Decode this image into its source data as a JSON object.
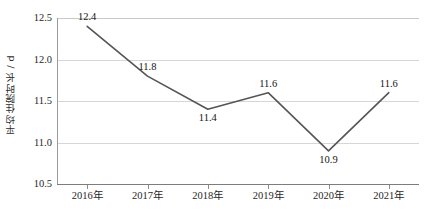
{
  "chart_data": {
    "type": "line",
    "title": "",
    "subtitle": "",
    "xlabel": "",
    "ylabel": "平均住院时长 / d",
    "categories": [
      "2016年",
      "2017年",
      "2018年",
      "2019年",
      "2020年",
      "2021年"
    ],
    "values": [
      12.4,
      11.8,
      11.4,
      11.6,
      10.9,
      11.6
    ],
    "point_labels": [
      "12.4",
      "11.8",
      "11.4",
      "11.6",
      "10.9",
      "11.6"
    ],
    "point_label_positions": [
      "above",
      "above",
      "below",
      "above",
      "below",
      "above"
    ],
    "ylim": [
      10.5,
      12.5
    ],
    "yticks": [
      12.5,
      12.0,
      11.5,
      11.0,
      10.5
    ],
    "ytick_labels": [
      "12.5",
      "12.0",
      "11.5",
      "11.0",
      "10.5"
    ],
    "grid": true,
    "grid_axis": "y",
    "legend": false,
    "legend_position": "none",
    "series": [
      {
        "name": "平均住院时长",
        "values": [
          12.4,
          11.8,
          11.4,
          11.6,
          10.9,
          11.6
        ],
        "color": "#555555"
      }
    ],
    "colors": {
      "line": "#555555",
      "gridline": "#d6d6d6",
      "axis": "#7d7d7d",
      "text": "#1f1f1f",
      "background": "#ffffff"
    }
  }
}
